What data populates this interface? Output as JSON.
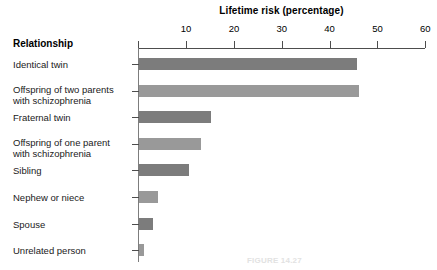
{
  "figure": {
    "category_header": "Relationship",
    "caption": "FIGURE 14.27"
  },
  "chart_data": {
    "type": "bar",
    "orientation": "horizontal",
    "title": "Lifetime risk (percentage)",
    "xlabel": "Lifetime risk (percentage)",
    "ylabel": "Relationship",
    "xlim": [
      0,
      60
    ],
    "xticks": [
      0,
      10,
      20,
      30,
      40,
      50,
      60
    ],
    "xtick_labels": [
      "",
      "10",
      "20",
      "30",
      "40",
      "50",
      "60"
    ],
    "grid": false,
    "legend": "none",
    "categories": [
      "Identical twin",
      "Offspring of two parents\nwith schizophrenia",
      "Fraternal twin",
      "Offspring of one parent\nwith schizophrenia",
      "Sibling",
      "Nephew or niece",
      "Spouse",
      "Unrelated person"
    ],
    "values": [
      45.5,
      46,
      15,
      13,
      10.5,
      4,
      3,
      1
    ],
    "bar_colors": [
      "#7c7c7c",
      "#999999",
      "#7c7c7c",
      "#999999",
      "#7c7c7c",
      "#999999",
      "#7c7c7c",
      "#999999"
    ]
  }
}
